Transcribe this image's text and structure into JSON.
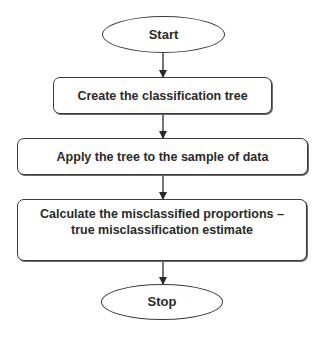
{
  "flowchart": {
    "nodes": [
      {
        "id": "start",
        "shape": "ellipse",
        "label": "Start"
      },
      {
        "id": "create",
        "shape": "rounded-rect",
        "label": "Create the classification tree"
      },
      {
        "id": "apply",
        "shape": "rounded-rect",
        "label": "Apply the tree to the sample of data"
      },
      {
        "id": "calc",
        "shape": "rounded-rect",
        "label_line1": "Calculate the misclassified proportions –",
        "label_line2": "true misclassification estimate"
      },
      {
        "id": "stop",
        "shape": "ellipse",
        "label": "Stop"
      }
    ],
    "edges": [
      {
        "from": "start",
        "to": "create"
      },
      {
        "from": "create",
        "to": "apply"
      },
      {
        "from": "apply",
        "to": "calc"
      },
      {
        "from": "calc",
        "to": "stop"
      }
    ],
    "colors": {
      "stroke": "#3a3a3a",
      "text": "#2a2a2a",
      "background": "#ffffff"
    }
  }
}
